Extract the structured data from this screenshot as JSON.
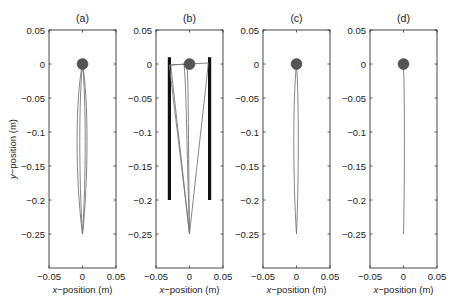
{
  "chart_data": [
    {
      "type": "line",
      "title": "(a)",
      "xlabel": "x-position (m)",
      "ylabel": "y-position (m)",
      "xlim": [
        -0.05,
        0.05
      ],
      "ylim": [
        -0.3,
        0.05
      ],
      "xticks": [
        "-0.05",
        "0",
        "0.05"
      ],
      "yticks": [
        "0.05",
        "0",
        "-0.05",
        "-0.1",
        "-0.15",
        "-0.2",
        "-0.25"
      ],
      "start_marker": {
        "x": 0,
        "y": 0
      },
      "trajectories": [
        {
          "name": "path-1",
          "start": [
            0,
            0
          ],
          "end": [
            0,
            -0.25
          ],
          "max_dx": -0.006
        },
        {
          "name": "path-2",
          "start": [
            0,
            0
          ],
          "end": [
            0,
            -0.25
          ],
          "max_dx": -0.003
        },
        {
          "name": "path-3",
          "start": [
            0,
            0
          ],
          "end": [
            0,
            -0.25
          ],
          "max_dx": 0.003
        },
        {
          "name": "path-4",
          "start": [
            0,
            0
          ],
          "end": [
            0,
            -0.25
          ],
          "max_dx": 0.005
        }
      ]
    },
    {
      "type": "line",
      "title": "(b)",
      "xlabel": "x-position (m)",
      "ylabel": "",
      "xlim": [
        -0.05,
        0.05
      ],
      "ylim": [
        -0.3,
        0.05
      ],
      "xticks": [
        "-0.05",
        "0",
        "0.05"
      ],
      "yticks": [
        "0.05",
        "0",
        "-0.05",
        "-0.1",
        "-0.15",
        "-0.2",
        "-0.25"
      ],
      "start_marker": {
        "x": 0,
        "y": 0
      },
      "obstacles": [
        {
          "name": "left-wall",
          "x": -0.03,
          "y_top": 0.01,
          "y_bottom": -0.2
        },
        {
          "name": "right-wall",
          "x": 0.03,
          "y_top": 0.01,
          "y_bottom": -0.2
        }
      ],
      "trajectories": [
        {
          "name": "path-1",
          "start": [
            -0.03,
            0
          ],
          "end": [
            0,
            -0.25
          ]
        },
        {
          "name": "path-2",
          "start": [
            -0.028,
            0
          ],
          "end": [
            0,
            -0.25
          ]
        },
        {
          "name": "path-3",
          "start": [
            -0.008,
            0
          ],
          "end": [
            0,
            -0.25
          ]
        },
        {
          "name": "path-4",
          "start": [
            -0.004,
            0
          ],
          "end": [
            0,
            -0.25
          ]
        },
        {
          "name": "path-5",
          "start": [
            0.028,
            0.003
          ],
          "end": [
            0,
            -0.25
          ]
        }
      ]
    },
    {
      "type": "line",
      "title": "(c)",
      "xlabel": "x-position (m)",
      "ylabel": "",
      "xlim": [
        -0.05,
        0.05
      ],
      "ylim": [
        -0.3,
        0.05
      ],
      "xticks": [
        "-0.05",
        "0",
        "0.05"
      ],
      "yticks": [
        "0.05",
        "0",
        "-0.05",
        "-0.1",
        "-0.15",
        "-0.2",
        "-0.25"
      ],
      "start_marker": {
        "x": 0,
        "y": 0
      },
      "trajectories": [
        {
          "name": "path-1",
          "start": [
            0,
            0
          ],
          "end": [
            0,
            -0.25
          ],
          "max_dx": -0.003
        },
        {
          "name": "path-2",
          "start": [
            0,
            0
          ],
          "end": [
            0,
            -0.25
          ],
          "max_dx": 0.002
        }
      ]
    },
    {
      "type": "line",
      "title": "(d)",
      "xlabel": "x-position (m)",
      "ylabel": "",
      "xlim": [
        -0.05,
        0.05
      ],
      "ylim": [
        -0.3,
        0.05
      ],
      "xticks": [
        "-0.05",
        "0",
        "0.05"
      ],
      "yticks": [
        "0.05",
        "0",
        "-0.05",
        "-0.1",
        "-0.15",
        "-0.2",
        "-0.25"
      ],
      "start_marker": {
        "x": 0,
        "y": 0
      },
      "trajectories": [
        {
          "name": "path-1",
          "start": [
            0,
            0
          ],
          "end": [
            0,
            -0.25
          ],
          "max_dx": 0.001
        }
      ]
    }
  ],
  "colors": {
    "axis": "#333333",
    "trajectory": "#777777",
    "marker": "#555555",
    "wall": "#111111"
  }
}
